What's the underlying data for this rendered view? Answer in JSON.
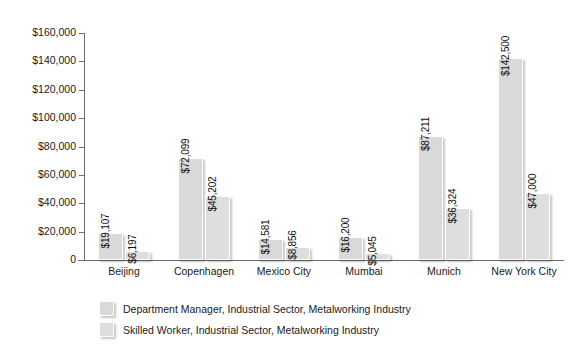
{
  "chart_data": {
    "type": "bar",
    "title": "",
    "subtitle": "",
    "xlabel": "",
    "ylabel": "",
    "grid": false,
    "legend_position": "bottom",
    "ylim": [
      0,
      160000
    ],
    "ytick_labels": [
      "$160,000",
      "$140,000",
      "$120,000",
      "$100,000",
      "$80,000",
      "$60,000",
      "$40,000",
      "$20,000",
      "0"
    ],
    "ytick_values": [
      160000,
      140000,
      120000,
      100000,
      80000,
      60000,
      40000,
      20000,
      0
    ],
    "categories": [
      "Beijing",
      "Copenhagen",
      "Mexico City",
      "Mumbai",
      "Munich",
      "New York City"
    ],
    "series": [
      {
        "name": "Department Manager, Industrial Sector, Metalworking Industry",
        "color": "#d9d9d9",
        "values": [
          19107,
          72099,
          14581,
          16200,
          87211,
          142500
        ],
        "labels": [
          "$19,107",
          "$72,099",
          "$14,581",
          "$16,200",
          "$87,211",
          "$142,500"
        ]
      },
      {
        "name": "Skilled Worker, Industrial Sector, Metalworking Industry",
        "color": "#dedede",
        "values": [
          6197,
          45202,
          8856,
          5045,
          36324,
          47000
        ],
        "labels": [
          "$6,197",
          "$45,202",
          "$8,856",
          "$5,045",
          "$36,324",
          "$47,000"
        ]
      }
    ]
  },
  "legend": {
    "items": [
      {
        "label": "Department Manager, Industrial Sector, Metalworking Industry"
      },
      {
        "label": "Skilled Worker, Industrial Sector, Metalworking Industry"
      }
    ]
  }
}
